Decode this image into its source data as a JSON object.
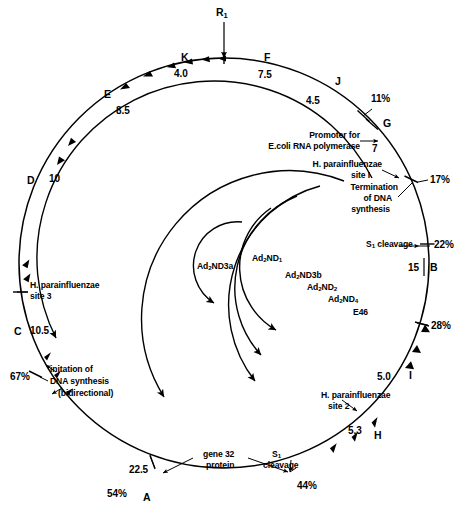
{
  "figure": {
    "type": "circular-genome-map",
    "outer_circle": {
      "origin_marker": "R",
      "origin_marker_sub": "1",
      "genes": [
        {
          "letter": "K",
          "value": "4.0"
        },
        {
          "letter": "F",
          "value": "7.5"
        },
        {
          "letter": "J",
          "value": "4.5"
        },
        {
          "letter": "G",
          "value": "7"
        },
        {
          "letter": "B",
          "value": "15"
        },
        {
          "letter": "I",
          "value": "5.0"
        },
        {
          "letter": "H",
          "value": "5.3"
        },
        {
          "letter": "A",
          "value": "22.5"
        },
        {
          "letter": "C",
          "value": "10.5"
        },
        {
          "letter": "D",
          "value": "10"
        },
        {
          "letter": "E",
          "value": "8.5"
        }
      ],
      "percent_marks": [
        "11%",
        "17%",
        "22%",
        "28%",
        "44%",
        "54%",
        "67%"
      ]
    },
    "annotations": [
      {
        "id": "promoter",
        "text_lines": [
          "Promoter for",
          "E.coli RNA polymerase"
        ]
      },
      {
        "id": "hpi-site-1",
        "text_lines": [
          "H. parainfluenzae",
          "site I"
        ]
      },
      {
        "id": "termination",
        "text_lines": [
          "Termination",
          "of DNA",
          "synthesis"
        ]
      },
      {
        "id": "s1-cleavage-right",
        "text_lines": [
          "S",
          "cleavage"
        ],
        "sub": "1"
      },
      {
        "id": "hpi-site-2",
        "text_lines": [
          "H. parainfluenzae",
          "site 2"
        ]
      },
      {
        "id": "s1-cleavage-bottom",
        "text_lines": [
          "S",
          "cleavage"
        ],
        "sub": "1"
      },
      {
        "id": "gene-32-protein",
        "text_lines": [
          "gene 32",
          "protein"
        ]
      },
      {
        "id": "initiation",
        "text_lines": [
          "initation of",
          "DNA synthesis",
          "(bidirectional)"
        ]
      },
      {
        "id": "hpi-site-3",
        "text_lines": [
          "H. parainfluenzae",
          "site 3"
        ]
      }
    ],
    "inner_arcs": [
      {
        "label": "Ad2ND3a",
        "prefix": "Ad",
        "sub1": "2",
        "mid": "ND3a"
      },
      {
        "label": "Ad2ND1",
        "prefix": "Ad",
        "sub1": "2",
        "mid": "ND",
        "sub2": "1"
      },
      {
        "label": "Ad2ND3b",
        "prefix": "Ad",
        "sub1": "2",
        "mid": "ND3b"
      },
      {
        "label": "Ad2ND2",
        "prefix": "Ad",
        "sub1": "2",
        "mid": "ND",
        "sub2": "2"
      },
      {
        "label": "Ad2ND4",
        "prefix": "Ad",
        "sub1": "2",
        "mid": "ND",
        "sub2": "4"
      },
      {
        "label": "E46",
        "prefix": "E46"
      }
    ]
  },
  "labels": {
    "origin_R": "R",
    "origin_R_sub": "1",
    "K": "K",
    "K_val": "4.0",
    "F": "F",
    "F_val": "7.5",
    "J": "J",
    "J_val": "4.5",
    "pct_11": "11%",
    "G": "G",
    "G_val": "7",
    "pct_17": "17%",
    "pct_22": "22%",
    "B": "B",
    "B_val": "15",
    "pct_28": "28%",
    "I": "I",
    "I_val": "5.0",
    "H": "H",
    "H_val": "5.3",
    "pct_44": "44%",
    "pct_54": "54%",
    "A": "A",
    "A_val": "22.5",
    "pct_67": "67%",
    "C": "C",
    "C_val": "10.5",
    "D": "D",
    "D_val": "10",
    "E": "E",
    "E_val": "8.5",
    "promoter_l1": "Promoter for",
    "promoter_l2": "E.coli RNA polymerase",
    "hpi1_l1": "H. parainfluenzae",
    "hpi1_l2": "site I",
    "term_l1": "Termination",
    "term_l2": "of DNA",
    "term_l3": "synthesis",
    "s1_right_l1": "S",
    "s1_right_sub": "1",
    "s1_right_l2": "cleavage",
    "hpi2_l1": "H. parainfluenzae",
    "hpi2_l2": "site 2",
    "s1_bot_l1": "S",
    "s1_bot_sub": "1",
    "s1_bot_l2": "cleavage",
    "g32_l1": "gene 32",
    "g32_l2": "protein",
    "init_l1": "initation of",
    "init_l2": "DNA synthesis",
    "init_l3": "(bidirectional)",
    "hpi3_l1": "H. parainfluenzae",
    "hpi3_l2": "site 3",
    "nd3a_a": "Ad",
    "nd3a_s": "2",
    "nd3a_b": "ND3a",
    "nd1_a": "Ad",
    "nd1_s": "2",
    "nd1_b": "ND",
    "nd1_s2": "1",
    "nd3b_a": "Ad",
    "nd3b_s": "2",
    "nd3b_b": "ND3b",
    "nd2_a": "Ad",
    "nd2_s": "2",
    "nd2_b": "ND",
    "nd2_s2": "2",
    "nd4_a": "Ad",
    "nd4_s": "2",
    "nd4_b": "ND",
    "nd4_s2": "4",
    "e46": "E46"
  },
  "colors": {
    "ink": "#000000",
    "paper": "#ffffff"
  }
}
